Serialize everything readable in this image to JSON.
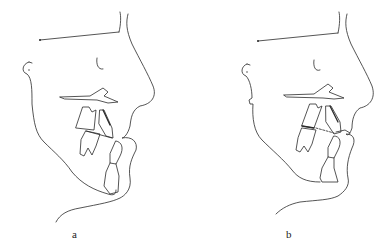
{
  "figure": {
    "panels": [
      {
        "id": "a",
        "label": "a",
        "description": "Cephalometric profile tracing, pre-treatment"
      },
      {
        "id": "b",
        "label": "b",
        "description": "Cephalometric profile tracing with occlusal reference (dashed line)"
      }
    ],
    "stroke_color": "#2a2a2a",
    "background_color": "#ffffff"
  }
}
